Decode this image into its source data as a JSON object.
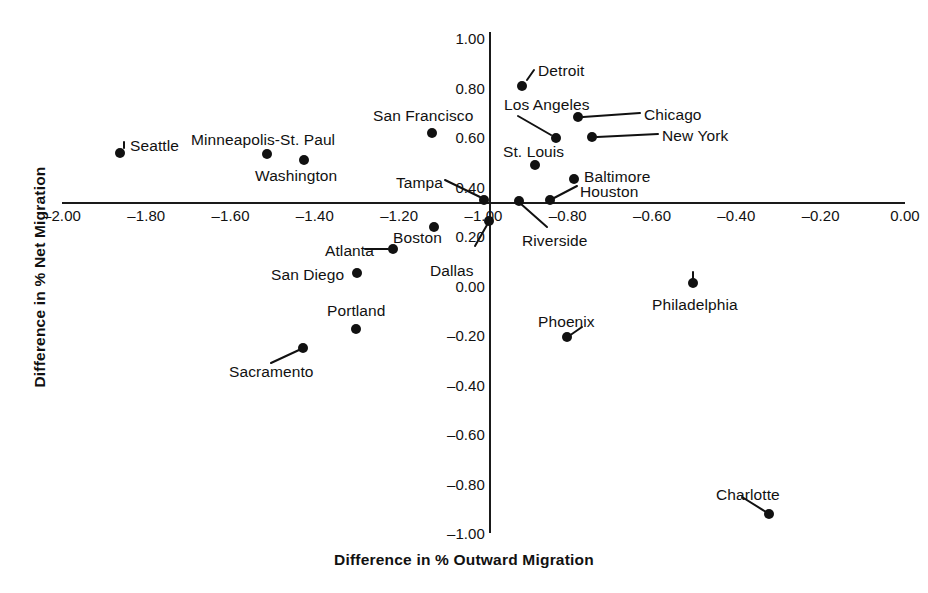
{
  "chart_data": {
    "type": "scatter",
    "title": "",
    "xlabel": "Difference in % Outward Migration",
    "ylabel": "Difference in % Net Migration",
    "xlim": [
      -2.1,
      0.05
    ],
    "ylim": [
      -1.02,
      1.02
    ],
    "grid": false,
    "legend": "none",
    "xticks": [
      "-2.00",
      "-1.80",
      "-1.60",
      "-1.40",
      "-1.20",
      "-1.00",
      "-0.80",
      "-0.60",
      "-0.40",
      "-0.20",
      "0.00"
    ],
    "xtick_values": [
      -2.0,
      -1.8,
      -1.6,
      -1.4,
      -1.2,
      -1.0,
      -0.8,
      -0.6,
      -0.4,
      -0.2,
      0.0
    ],
    "yticks": [
      "1.00",
      "0.80",
      "0.60",
      "0.40",
      "0.20",
      "0.00",
      "-0.20",
      "-0.40",
      "-0.60",
      "-0.80",
      "-1.00"
    ],
    "ytick_values": [
      1.0,
      0.8,
      0.6,
      0.4,
      0.2,
      0.0,
      -0.2,
      -0.4,
      -0.6,
      -0.8,
      -1.0
    ],
    "points": [
      {
        "name": "Seattle",
        "x": -1.9,
        "y": 0.6,
        "px": 120,
        "py": 153,
        "lx": 130,
        "ly": 137,
        "leader": [
          124,
          142,
          124,
          148
        ]
      },
      {
        "name": "Minneapolis-St. Paul",
        "x": -1.55,
        "y": 0.56,
        "px": 267,
        "py": 154,
        "lx": 191,
        "ly": 131,
        "leader": null
      },
      {
        "name": "Washington",
        "x": -1.45,
        "y": 0.53,
        "px": 304,
        "py": 160,
        "lx": 255,
        "ly": 167,
        "leader": null
      },
      {
        "name": "San Francisco",
        "x": -1.11,
        "y": 0.68,
        "px": 432,
        "py": 133,
        "lx": 373,
        "ly": 107,
        "leader": null
      },
      {
        "name": "Detroit",
        "x": -0.79,
        "y": 0.84,
        "px": 522,
        "py": 86,
        "lx": 538,
        "ly": 62,
        "leader": [
          527,
          80,
          534,
          70
        ]
      },
      {
        "name": "Los Angeles",
        "x": -0.73,
        "y": 0.63,
        "px": 556,
        "py": 138,
        "lx": 504,
        "ly": 96,
        "leader": [
          518,
          116,
          551,
          135
        ]
      },
      {
        "name": "Chicago",
        "x": -0.7,
        "y": 0.7,
        "px": 578,
        "py": 117,
        "lx": 644,
        "ly": 106,
        "leader": [
          583,
          117,
          640,
          113
        ]
      },
      {
        "name": "New York",
        "x": -0.67,
        "y": 0.62,
        "px": 592,
        "py": 137,
        "lx": 662,
        "ly": 127,
        "leader": [
          597,
          137,
          658,
          134
        ]
      },
      {
        "name": "St. Louis",
        "x": -0.76,
        "y": 0.52,
        "px": 535,
        "py": 165,
        "lx": 503,
        "ly": 143,
        "leader": null
      },
      {
        "name": "Baltimore",
        "x": -0.69,
        "y": 0.44,
        "px": 574,
        "py": 179,
        "lx": 584,
        "ly": 168,
        "leader": null
      },
      {
        "name": "Houston",
        "x": -0.78,
        "y": 0.4,
        "px": 550,
        "py": 200,
        "lx": 580,
        "ly": 183,
        "leader": [
          554,
          198,
          577,
          186
        ]
      },
      {
        "name": "Tampa",
        "x": -1.02,
        "y": 0.4,
        "px": 484,
        "py": 200,
        "lx": 396,
        "ly": 174,
        "leader": [
          445,
          180,
          480,
          197
        ]
      },
      {
        "name": "Riverside",
        "x": -0.89,
        "y": 0.4,
        "px": 519,
        "py": 201,
        "lx": 522,
        "ly": 232,
        "leader": [
          521,
          204,
          547,
          227
        ]
      },
      {
        "name": "Boston",
        "x": -1.09,
        "y": 0.24,
        "px": 434,
        "py": 227,
        "lx": 393,
        "ly": 229,
        "leader": null
      },
      {
        "name": "Dallas",
        "x": -0.99,
        "y": 0.22,
        "px": 489,
        "py": 221,
        "lx": 430,
        "ly": 262,
        "leader": [
          475,
          246,
          487,
          225
        ]
      },
      {
        "name": "Atlanta",
        "x": -1.15,
        "y": 0.16,
        "px": 393,
        "py": 249,
        "lx": 325,
        "ly": 242,
        "leader": [
          365,
          249,
          388,
          249
        ]
      },
      {
        "name": "San Diego",
        "x": -1.2,
        "y": 0.09,
        "px": 357,
        "py": 273,
        "lx": 271,
        "ly": 266,
        "leader": null
      },
      {
        "name": "Portland",
        "x": -1.22,
        "y": -0.12,
        "px": 356,
        "py": 329,
        "lx": 327,
        "ly": 302,
        "leader": null
      },
      {
        "name": "Sacramento",
        "x": -1.3,
        "y": -0.2,
        "px": 303,
        "py": 348,
        "lx": 229,
        "ly": 363,
        "leader": [
          271,
          363,
          299,
          350
        ]
      },
      {
        "name": "Phoenix",
        "x": -0.83,
        "y": -0.18,
        "px": 567,
        "py": 337,
        "lx": 538,
        "ly": 313,
        "leader": [
          569,
          336,
          582,
          327
        ]
      },
      {
        "name": "Philadelphia",
        "x": -0.47,
        "y": 0.03,
        "px": 693,
        "py": 283,
        "lx": 652,
        "ly": 296,
        "leader": [
          693,
          272,
          693,
          280
        ]
      },
      {
        "name": "Charlotte",
        "x": -0.31,
        "y": -0.89,
        "px": 769,
        "py": 514,
        "lx": 716,
        "ly": 486,
        "leader": [
          742,
          497,
          766,
          512
        ]
      }
    ]
  },
  "colors": {
    "ink": "#111111",
    "background": "#ffffff",
    "marker": "#111111"
  }
}
